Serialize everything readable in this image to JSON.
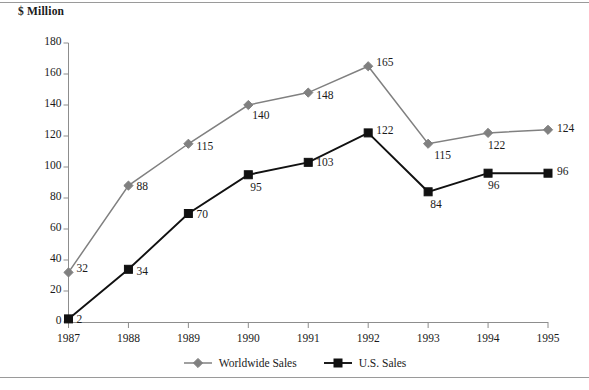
{
  "figure": {
    "axis_unit_label": "$ Million",
    "border_color": "#9a9a9a"
  },
  "chart_data": {
    "type": "line",
    "title": "",
    "xlabel": "",
    "ylabel": "$ Million",
    "categories": [
      "1987",
      "1988",
      "1989",
      "1990",
      "1991",
      "1992",
      "1993",
      "1994",
      "1995"
    ],
    "x_tick_labels": [
      "1987",
      "1988",
      "1989",
      "1990",
      "1991",
      "1992",
      "1993",
      "1994",
      "1995"
    ],
    "y_tick_labels": [
      "0",
      "20",
      "40",
      "60",
      "80",
      "100",
      "120",
      "140",
      "160",
      "180"
    ],
    "y_ticks": [
      0,
      20,
      40,
      60,
      80,
      100,
      120,
      140,
      160,
      180
    ],
    "ylim": [
      0,
      180
    ],
    "grid": false,
    "legend_position": "bottom-center",
    "series": [
      {
        "name": "Worldwide Sales",
        "color": "#808080",
        "marker": "diamond",
        "values": [
          32,
          88,
          115,
          140,
          148,
          165,
          115,
          122,
          124
        ],
        "data_labels": [
          "32",
          "88",
          "115",
          "140",
          "148",
          "165",
          "115",
          "122",
          "124"
        ]
      },
      {
        "name": "U.S. Sales",
        "color": "#111111",
        "marker": "square",
        "values": [
          2,
          34,
          70,
          95,
          103,
          122,
          84,
          96,
          96
        ],
        "data_labels": [
          "2",
          "34",
          "70",
          "95",
          "103",
          "122",
          "84",
          "96",
          "96"
        ]
      }
    ]
  },
  "legend": {
    "items": [
      {
        "label": "Worldwide Sales",
        "color": "#808080",
        "marker": "diamond"
      },
      {
        "label": "U.S. Sales",
        "color": "#111111",
        "marker": "square"
      }
    ]
  }
}
